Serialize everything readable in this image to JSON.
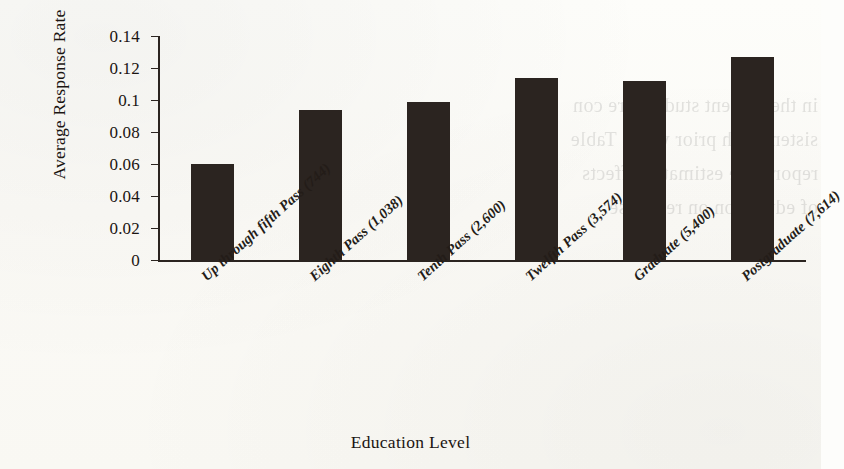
{
  "figure": {
    "background_color": "#fdfdfb",
    "ink_color": "#2b2420",
    "showthrough_text": "show-through text from reverse page"
  },
  "chart_data": {
    "type": "bar",
    "title": "",
    "xlabel": "Education Level",
    "ylabel": "Average Response Rate",
    "categories": [
      "Up through fifth Pass (744)",
      "Eighth Pass (1,038)",
      "Tenth Pass (2,600)",
      "Twelfth Pass (3,574)",
      "Graduate (5,400)",
      "Postgraduate (7,614)"
    ],
    "values": [
      0.06,
      0.094,
      0.099,
      0.114,
      0.112,
      0.127
    ],
    "ylim": [
      0,
      0.14
    ],
    "ytick_labels": [
      "0.14",
      "0.12",
      "0.1",
      "0.08",
      "0.06",
      "0.04",
      "0.02",
      "0"
    ],
    "ytick_values": [
      0.14,
      0.12,
      0.1,
      0.08,
      0.06,
      0.04,
      0.02,
      0
    ],
    "grid": false,
    "legend": null,
    "bar_color": "#2b2420"
  }
}
